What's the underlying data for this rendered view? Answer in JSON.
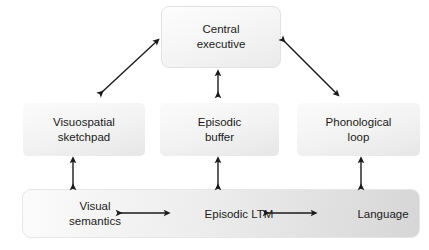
{
  "diagram": {
    "stroke_color": "#1a1a1a",
    "text_color": "#1b1b1b",
    "background": "#ffffff",
    "nodes": {
      "central_executive": "Central\nexecutive",
      "visuospatial_sketchpad": "Visuospatial\nsketchpad",
      "episodic_buffer": "Episodic\nbuffer",
      "phonological_loop": "Phonological\nloop",
      "visual_semantics": "Visual\nsemantics",
      "episodic_ltm": "Episodic LTM",
      "language": "Language"
    },
    "connectors": [
      {
        "name": "central-to-visuospatial",
        "from": "Central executive",
        "to": "Visuospatial sketchpad",
        "style": "double-headed",
        "orientation": "diagonal"
      },
      {
        "name": "central-to-episodic-buffer",
        "from": "Central executive",
        "to": "Episodic buffer",
        "style": "double-headed",
        "orientation": "vertical"
      },
      {
        "name": "central-to-phonological",
        "from": "Central executive",
        "to": "Phonological loop",
        "style": "double-headed",
        "orientation": "diagonal"
      },
      {
        "name": "visuospatial-to-visual-semantics",
        "from": "Visuospatial sketchpad",
        "to": "Visual semantics",
        "style": "double-headed",
        "orientation": "vertical"
      },
      {
        "name": "episodic-buffer-to-episodic-ltm",
        "from": "Episodic buffer",
        "to": "Episodic LTM",
        "style": "double-headed",
        "orientation": "vertical"
      },
      {
        "name": "phonological-to-language",
        "from": "Phonological loop",
        "to": "Language",
        "style": "double-headed",
        "orientation": "vertical"
      },
      {
        "name": "visual-semantics-to-episodic-ltm",
        "from": "Visual semantics",
        "to": "Episodic LTM",
        "style": "double-headed",
        "orientation": "horizontal"
      },
      {
        "name": "episodic-ltm-to-language",
        "from": "Episodic LTM",
        "to": "Language",
        "style": "double-headed",
        "orientation": "horizontal"
      }
    ]
  }
}
